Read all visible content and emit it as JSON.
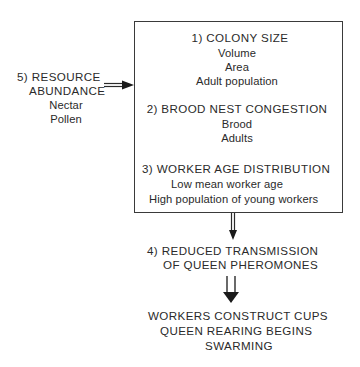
{
  "diagram": {
    "resource": {
      "heading_line1": "5) RESOURCE",
      "heading_line2": "ABUNDANCE",
      "items": [
        "Nectar",
        "Pollen"
      ]
    },
    "box": {
      "colony_size": {
        "heading": "1) COLONY  SIZE",
        "items": [
          "Volume",
          "Area",
          "Adult population"
        ]
      },
      "brood_nest": {
        "heading": "2) BROOD NEST CONGESTION",
        "items": [
          "Brood",
          "Adults"
        ]
      },
      "worker_age": {
        "heading": "3)  WORKER AGE DISTRIBUTION",
        "items": [
          "Low mean worker age",
          "High population of young workers"
        ]
      }
    },
    "pheromones": {
      "line1": "4) REDUCED TRANSMISSION",
      "line2": "OF  QUEEN  PHEROMONES"
    },
    "outcomes": [
      "WORKERS CONSTRUCT CUPS",
      "QUEEN REARING BEGINS",
      "SWARMING"
    ],
    "colors": {
      "line": "#2a2a2a",
      "background": "#ffffff"
    }
  }
}
